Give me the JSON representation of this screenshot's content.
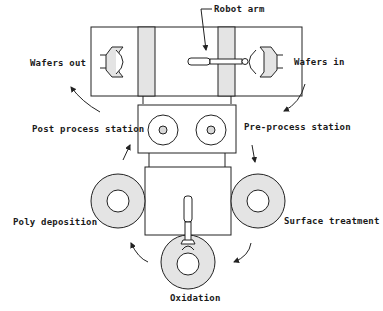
{
  "labels": {
    "robot_arm": "Robot arm",
    "wafers_out": "Wafers out",
    "wafers_in": "Wafers in",
    "post_process": "Post process station",
    "pre_process": "Pre-process station",
    "poly_deposition": "Poly deposition",
    "surface_treatment": "Surface treatment",
    "oxidation": "Oxidation"
  },
  "colors": {
    "stroke": "#222222",
    "fill_gray": "#e4e4e4",
    "background": "#ffffff"
  }
}
